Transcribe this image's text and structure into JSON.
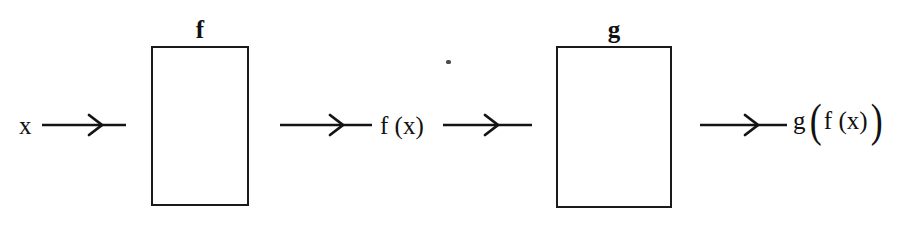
{
  "diagram": {
    "type": "function-composition-flowchart",
    "background_color": "#ffffff",
    "ink_color": "#111111",
    "boxes": [
      {
        "id": "f",
        "label": "f"
      },
      {
        "id": "g",
        "label": "g"
      }
    ],
    "labels": {
      "input": "x",
      "intermediate": "f (x)",
      "output_function": "g",
      "output_inner": "f (x)",
      "paren_open": "(",
      "paren_close": ")"
    },
    "arrows": [
      {
        "id": "arrow-1",
        "from": "x",
        "to": "f-box"
      },
      {
        "id": "arrow-2",
        "from": "f-box",
        "to": "f(x)"
      },
      {
        "id": "arrow-3",
        "from": "f(x)",
        "to": "g-box"
      },
      {
        "id": "arrow-4",
        "from": "g-box",
        "to": "g(f(x))"
      }
    ]
  }
}
